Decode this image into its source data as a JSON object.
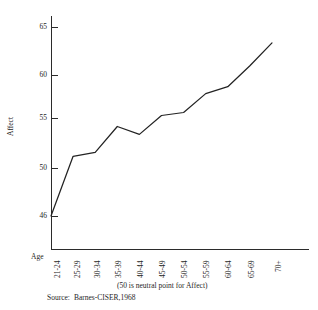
{
  "chart_data": {
    "type": "line",
    "title": "",
    "xlabel": "Age",
    "ylabel": "Affect",
    "categories": [
      "21-24",
      "25-29",
      "30-34",
      "35-39",
      "40-44",
      "45-49",
      "50-54",
      "55-59",
      "60-64",
      "65-69",
      "70+"
    ],
    "values": [
      46.0,
      52.0,
      52.4,
      55.0,
      54.2,
      56.1,
      56.4,
      58.3,
      59.0,
      61.1,
      63.4
    ],
    "series": [
      {
        "name": "Affect",
        "values": [
          46.0,
          52.0,
          52.4,
          55.0,
          54.2,
          56.1,
          56.4,
          58.3,
          59.0,
          61.1,
          63.4
        ]
      }
    ],
    "ylim": [
      46,
      66
    ],
    "ytick_labels": [
      "65",
      "60",
      "55",
      "50",
      "46"
    ],
    "ytick_values": [
      65,
      60,
      55,
      50,
      46
    ],
    "grid": false,
    "legend": false,
    "note": "(50 is neutral point for Affect)",
    "source": "Barnes-CISER,1968",
    "source_label": "Source:",
    "line_color": "#232323",
    "axis_color": "#2b2b2b"
  }
}
